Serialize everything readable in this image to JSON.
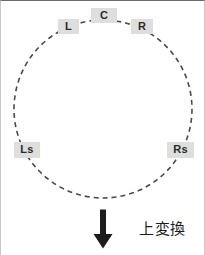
{
  "figure": {
    "width": 205,
    "height": 255,
    "background_color": "#ffffff",
    "border_color": "#6b6b6b"
  },
  "diagram": {
    "type": "speaker-layout-ring",
    "ring": {
      "center_x": 102,
      "center_y": 108,
      "radius": 89,
      "stroke_color": "#4a4a4a",
      "stroke_width": 1.6,
      "dash_pattern": "5 4",
      "style": "dashed-circle"
    },
    "speakers": [
      {
        "id": "C",
        "label": "C",
        "angle_deg": 90,
        "position": "top-center"
      },
      {
        "id": "L",
        "label": "L",
        "angle_deg": 120,
        "position": "top-left"
      },
      {
        "id": "R",
        "label": "R",
        "angle_deg": 60,
        "position": "top-right"
      },
      {
        "id": "Ls",
        "label": "Ls",
        "angle_deg": 200,
        "position": "bottom-left"
      },
      {
        "id": "Rs",
        "label": "Rs",
        "angle_deg": 340,
        "position": "bottom-right"
      }
    ],
    "label_style": {
      "background_color": "#dededc",
      "text_color": "#2b2b2b"
    }
  },
  "conversion": {
    "arrow_direction": "down",
    "arrow_color": "#1c1c1c",
    "caption": "上変換"
  }
}
